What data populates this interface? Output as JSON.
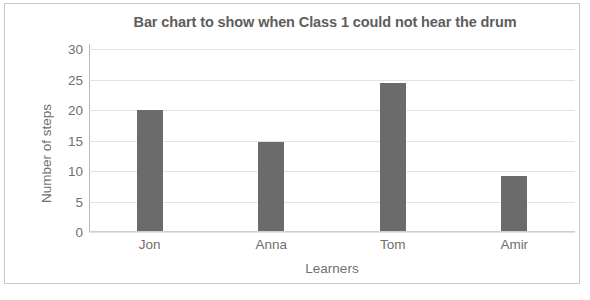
{
  "chart_data": {
    "type": "bar",
    "title": "Bar chart to show when Class 1 could not hear the drum",
    "xlabel": "Learners",
    "ylabel": "Number of steps",
    "categories": [
      "Jon",
      "Anna",
      "Tom",
      "Amir"
    ],
    "values": [
      20,
      14.7,
      24.5,
      9.2
    ],
    "yticks": [
      0,
      5,
      10,
      15,
      20,
      25,
      30
    ],
    "ylim": [
      0,
      30
    ],
    "grid": true,
    "legend": false,
    "bar_color": "#6b6b6b",
    "gridline_color": "#e2e2e2",
    "text_color": "#6f6f6f",
    "title_color": "#5d5d5d"
  }
}
